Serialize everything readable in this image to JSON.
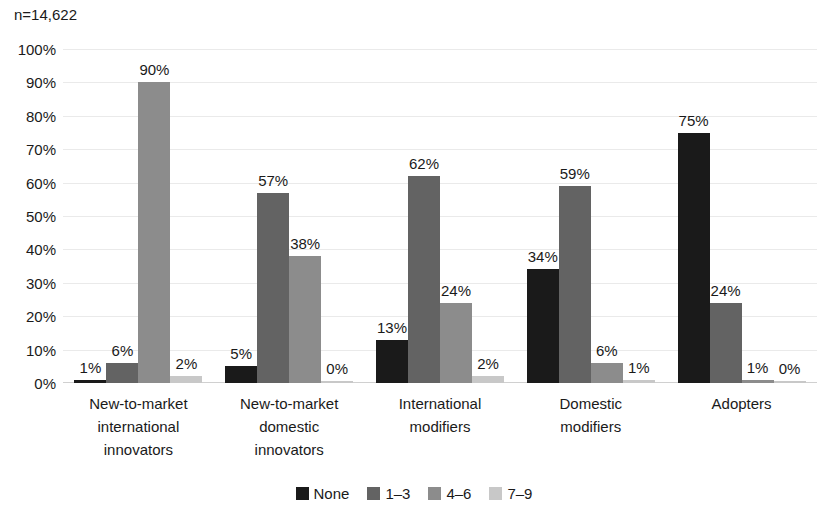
{
  "annotation": {
    "sample_size": "n=14,622"
  },
  "chart_data": {
    "type": "bar",
    "title": "",
    "subtitle": "",
    "xlabel": "",
    "ylabel": "",
    "ylim": [
      0,
      100
    ],
    "y_ticks": [
      "0%",
      "10%",
      "20%",
      "30%",
      "40%",
      "50%",
      "60%",
      "70%",
      "80%",
      "90%",
      "100%"
    ],
    "y_tick_values": [
      0,
      10,
      20,
      30,
      40,
      50,
      60,
      70,
      80,
      90,
      100
    ],
    "grid": true,
    "legend_position": "bottom",
    "annotations": [
      "n=14,622"
    ],
    "categories": [
      "New-to-market international innovators",
      "New-to-market domestic innovators",
      "International modifiers",
      "Domestic modifiers",
      "Adopters"
    ],
    "category_lines": [
      [
        "New-to-market",
        "international",
        "innovators"
      ],
      [
        "New-to-market",
        "domestic",
        "innovators"
      ],
      [
        "International",
        "modifiers"
      ],
      [
        "Domestic",
        "modifiers"
      ],
      [
        "Adopters"
      ]
    ],
    "series": [
      {
        "name": "None",
        "color": "#1a1a1a",
        "values": [
          1,
          5,
          13,
          34,
          75
        ],
        "labels": [
          "1%",
          "5%",
          "13%",
          "34%",
          "75%"
        ]
      },
      {
        "name": "1–3",
        "color": "#636363",
        "values": [
          6,
          57,
          62,
          59,
          24
        ],
        "labels": [
          "6%",
          "57%",
          "62%",
          "59%",
          "24%"
        ]
      },
      {
        "name": "4–6",
        "color": "#8c8c8c",
        "values": [
          90,
          38,
          24,
          6,
          1
        ],
        "labels": [
          "90%",
          "38%",
          "24%",
          "6%",
          "1%"
        ]
      },
      {
        "name": "7–9",
        "color": "#c8c8c8",
        "values": [
          2,
          0,
          2,
          1,
          0
        ],
        "labels": [
          "2%",
          "0%",
          "2%",
          "1%",
          "0%"
        ]
      }
    ]
  }
}
